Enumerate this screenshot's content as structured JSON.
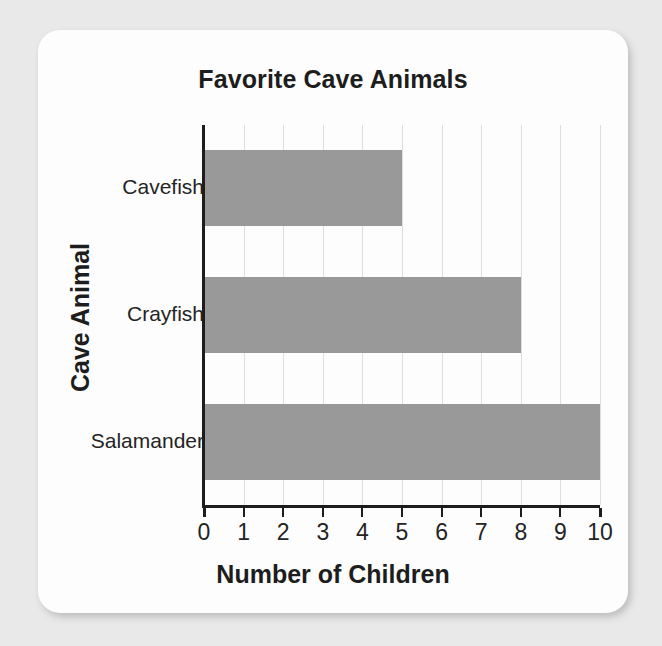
{
  "chart_data": {
    "type": "bar",
    "orientation": "horizontal",
    "title": "Favorite Cave Animals",
    "xlabel": "Number of Children",
    "ylabel": "Cave Animal",
    "categories": [
      "Cavefish",
      "Crayfish",
      "Salamander"
    ],
    "values": [
      5,
      8,
      10
    ],
    "xlim": [
      0,
      10
    ],
    "xticks": [
      "0",
      "1",
      "2",
      "3",
      "4",
      "5",
      "6",
      "7",
      "8",
      "9",
      "10"
    ],
    "grid": "vertical",
    "legend": "none",
    "bar_color": "#999999",
    "axis_color": "#1d1d1d",
    "gridline_color": "#dedede",
    "card_color": "#fdfdfd",
    "background_color": "#e9e9e9"
  }
}
